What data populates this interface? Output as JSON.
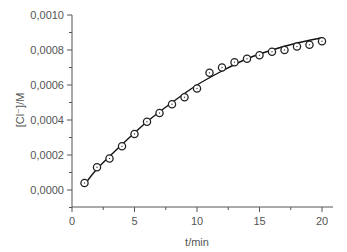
{
  "chart_data": {
    "type": "scatter",
    "title": "",
    "xlabel": "t/min",
    "ylabel": "[Cl⁻]/M",
    "xlim": [
      0,
      20.8
    ],
    "ylim": [
      -0.0001,
      0.001
    ],
    "xticks": [
      0,
      5,
      10,
      15,
      20
    ],
    "xtick_labels": [
      "0",
      "5",
      "10",
      "15",
      "20"
    ],
    "yticks": [
      0.0,
      0.0002,
      0.0004,
      0.0006,
      0.0008,
      0.001
    ],
    "ytick_labels": [
      "0,0000",
      "0,0002",
      "0,0004",
      "0,0006",
      "0,0008",
      "0,0010"
    ],
    "grid": false,
    "legend": null,
    "series": [
      {
        "name": "measured",
        "style": "open-circle-marker",
        "x": [
          1,
          2,
          3,
          4,
          5,
          6,
          7,
          8,
          9,
          10,
          11,
          12,
          13,
          14,
          15,
          16,
          17,
          18,
          19,
          20
        ],
        "y": [
          4e-05,
          0.00013,
          0.00018,
          0.00025,
          0.00032,
          0.00039,
          0.00044,
          0.00049,
          0.00053,
          0.00058,
          0.00067,
          0.0007,
          0.00073,
          0.00075,
          0.00077,
          0.00079,
          0.0008,
          0.00082,
          0.00083,
          0.00085
        ]
      },
      {
        "name": "fit",
        "style": "solid-line",
        "x": [
          0.9,
          2,
          4,
          6,
          8,
          10,
          12,
          14,
          16,
          18,
          20
        ],
        "y": [
          2e-05,
          0.00012,
          0.00026,
          0.00039,
          0.0005,
          0.0006,
          0.00068,
          0.00075,
          0.0008,
          0.00084,
          0.00087
        ]
      }
    ]
  }
}
